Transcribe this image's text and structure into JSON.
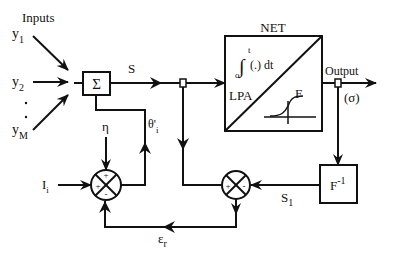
{
  "diagram": {
    "inputs_label": "Inputs",
    "inputs": [
      {
        "sym": "y",
        "sub": "1"
      },
      {
        "sym": "y",
        "sub": "2"
      },
      {
        "sym": "y",
        "sub": "M"
      }
    ],
    "ellipsis": ". .",
    "sum_block": {
      "symbol": "Σ"
    },
    "signal_s": "S",
    "net_block": {
      "title": "NET",
      "integral_lower": "o",
      "integral_upper": "t",
      "integral_symbol": "∫",
      "integral_body": "(.) dt",
      "lpa_label": "LPA",
      "f_label": "F"
    },
    "output_label": "Output",
    "sigma_label": "(σ)",
    "inverse_block": {
      "base": "F",
      "sup": "-1"
    },
    "signal_s1": {
      "sym": "S",
      "sub": "1"
    },
    "error_label": {
      "sym": "ε",
      "sub": "r"
    },
    "eta_label": "η",
    "theta_label": {
      "sym": "θ'",
      "sub": "i"
    },
    "current_label": {
      "sym": "I",
      "sub": "i"
    },
    "left_junction_signs": {
      "top": "+",
      "left": "+",
      "bottom": "-"
    },
    "right_junction_signs": {
      "left": "+",
      "right": "-"
    }
  }
}
